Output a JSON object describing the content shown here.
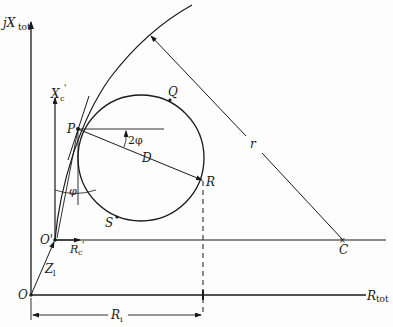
{
  "diagram": {
    "type": "impedance circle diagram",
    "axes": {
      "main_vertical_label": "jX",
      "main_vertical_sub": "tot",
      "main_horizontal_label": "R",
      "main_horizontal_sub": "tot",
      "origin_label": "O",
      "shifted_origin_label": "O'",
      "shifted_vertical_label": "X",
      "shifted_vertical_sub": "c",
      "shifted_vertical_prime": "'",
      "shifted_horizontal_label": "R",
      "shifted_horizontal_sub": "c",
      "shifted_horizontal_prime": "'"
    },
    "points": {
      "P": "P",
      "Q": "Q",
      "R": "R",
      "S": "S",
      "C": "C"
    },
    "dimensions": {
      "diameter": "D",
      "radius": "r",
      "angle_double": "2φ",
      "angle": "φ",
      "impedance": "Z",
      "impedance_sub": "l",
      "resistance_span": "R",
      "resistance_span_sub": "i"
    },
    "colors": {
      "line": "#1a1a1a",
      "background": "#fdfdfd"
    }
  }
}
